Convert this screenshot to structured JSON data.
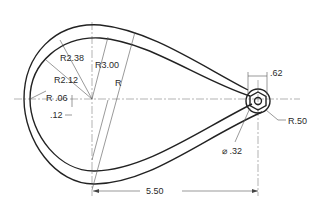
{
  "drawing": {
    "type": "mechanical-drawing",
    "subject": "teardrop link arm with hex hub",
    "dimensions": {
      "r_inner_large": "R2.12",
      "r_outer_large": "R2.38",
      "r_centerline": "R3.00",
      "r_unspecified": "R",
      "r_fillet": "R .06",
      "offset": ".12",
      "hub_width": ".62",
      "hub_radius": "R.50",
      "hole_diameter": "⌀ .32",
      "center_distance": "5.50"
    }
  }
}
